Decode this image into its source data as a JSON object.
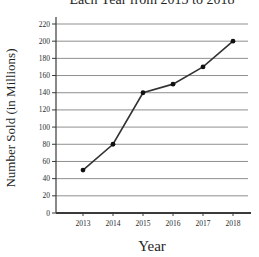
{
  "chart_data": {
    "type": "line",
    "title": "Each Year from 2013 to 2018",
    "xlabel": "Year",
    "ylabel": "Number Sold (in Millions)",
    "categories": [
      "2013",
      "2014",
      "2015",
      "2016",
      "2017",
      "2018"
    ],
    "series": [
      {
        "name": "Number Sold (in Millions)",
        "values": [
          50,
          80,
          140,
          150,
          170,
          200
        ]
      }
    ],
    "ylim": [
      0,
      220
    ],
    "ytick_step": 20,
    "grid": true,
    "legend": "none",
    "colors": {
      "line": "#333333",
      "marker": "#111111",
      "grid": "#8f8f8f",
      "axis": "#3a3a3a",
      "text": "#2a2a2a",
      "background": "#ffffff"
    }
  }
}
